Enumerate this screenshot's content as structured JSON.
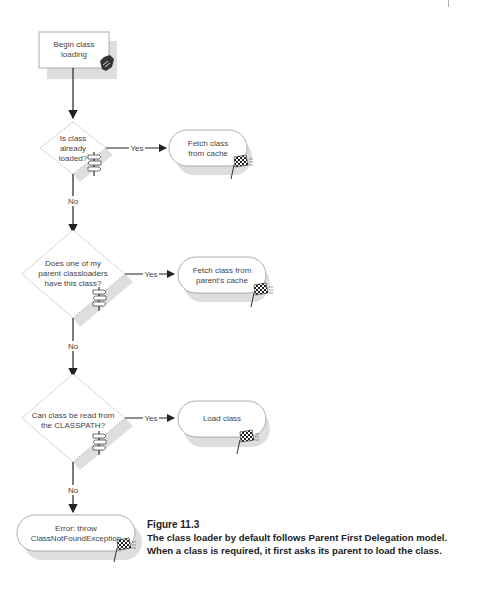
{
  "diagram": {
    "start": {
      "label_lines": [
        "Begin class",
        "loading"
      ]
    },
    "decisions": [
      {
        "id": "d1",
        "label_lines": [
          "Is class",
          "already",
          "loaded?"
        ],
        "yes_label": "Yes",
        "no_label": "No"
      },
      {
        "id": "d2",
        "label_lines": [
          "Does one of my",
          "parent classloaders",
          "have this class?"
        ],
        "yes_label": "Yes",
        "no_label": "No"
      },
      {
        "id": "d3",
        "label_lines": [
          "Can class be read from",
          "the CLASSPATH?"
        ],
        "yes_label": "Yes",
        "no_label": "No"
      }
    ],
    "terminals": [
      {
        "id": "t1",
        "label_lines": [
          "Fetch class",
          "from cache"
        ]
      },
      {
        "id": "t2",
        "label_lines": [
          "Fetch class from",
          "parent's cache"
        ]
      },
      {
        "id": "t3",
        "label_lines": [
          "Load class"
        ]
      },
      {
        "id": "t4",
        "label_lines": [
          "Error: throw",
          "ClassNotFoundException"
        ]
      }
    ],
    "icons": {
      "start": "hand-icon",
      "decision": "signpost-icon",
      "terminal": "checkered-flag-icon"
    },
    "colors": {
      "line": "#222222",
      "shape_border": "#9a9a9a",
      "shadow": "#dcdcdc",
      "text": "#444444"
    }
  },
  "caption": {
    "figure_number": "Figure 11.3",
    "line1": "The class loader by default follows Parent First Delegation model.",
    "line2": "When a class is required, it first asks its parent to load the class."
  }
}
